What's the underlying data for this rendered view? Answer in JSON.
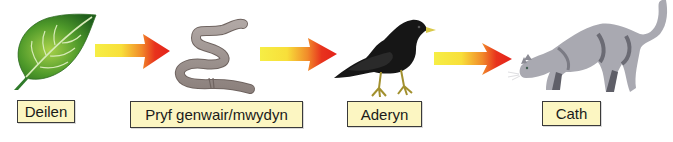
{
  "diagram": {
    "type": "food-chain",
    "colors": {
      "label_fill": "#fcf6c2",
      "label_border": "#3a3a3a",
      "arrow_tail": "#f6ec3a",
      "arrow_head": "#e8261c"
    },
    "organisms": [
      {
        "id": "leaves",
        "label": "Deilen",
        "icon": "leaf-icon"
      },
      {
        "id": "earthworm",
        "label": "Pryf genwair/mwydyn",
        "icon": "earthworm-icon"
      },
      {
        "id": "bird",
        "label": "Aderyn",
        "icon": "bird-icon"
      },
      {
        "id": "cat",
        "label": "Cath",
        "icon": "cat-icon"
      }
    ],
    "arrows": [
      {
        "from": "Deilen",
        "to": "Pryf genwair/mwydyn"
      },
      {
        "from": "Pryf genwair/mwydyn",
        "to": "Aderyn"
      },
      {
        "from": "Aderyn",
        "to": "Cath"
      }
    ]
  }
}
